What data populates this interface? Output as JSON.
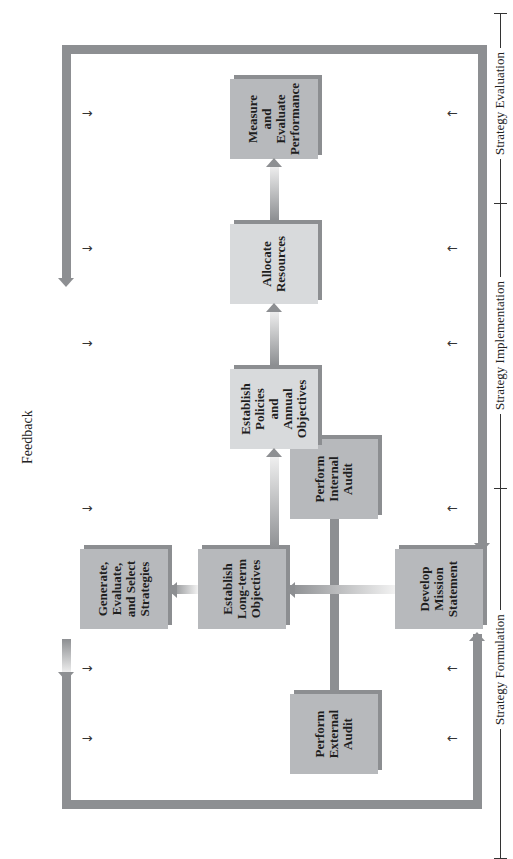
{
  "diagram": {
    "orientation": "rotated -90deg (flow reads bottom to top on screen)",
    "feedback_label": "Feedback",
    "boxes": [
      {
        "id": "develop-mission",
        "label": "Develop\nMission\nStatement"
      },
      {
        "id": "external-audit",
        "label": "Perform\nExternal\nAudit"
      },
      {
        "id": "internal-audit",
        "label": "Perform\nInternal\nAudit"
      },
      {
        "id": "long-term-objectives",
        "label": "Establish\nLong-term\nObjectives"
      },
      {
        "id": "generate-strategies",
        "label": "Generate,\nEvaluate,\nand Select\nStrategies"
      },
      {
        "id": "policies-objectives",
        "label": "Establish\nPolicies\nand\nAnnual\nObjectives"
      },
      {
        "id": "allocate-resources",
        "label": "Allocate\nResources"
      },
      {
        "id": "measure-performance",
        "label": "Measure\nand\nEvaluate\nPerformance"
      }
    ],
    "phases": [
      {
        "label": "Strategy Formulation"
      },
      {
        "label": "Strategy Implementation"
      },
      {
        "label": "Strategy Evaluation"
      }
    ],
    "small_arrows": {
      "top": [
        "↓",
        "↓",
        "↓",
        "↓",
        "↓",
        "↓"
      ],
      "bottom": [
        "↑",
        "↑",
        "↑",
        "↑",
        "↑",
        "↑"
      ]
    }
  }
}
